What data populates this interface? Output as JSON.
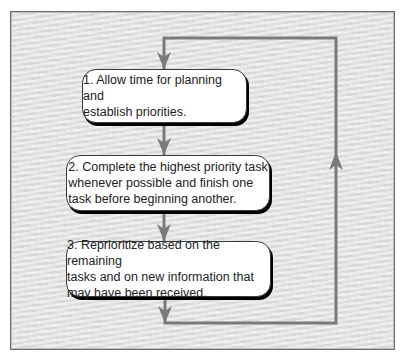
{
  "diagram": {
    "type": "flowchart",
    "colors": {
      "panel_background": "#e3e3e3",
      "panel_border": "#6e6e6e",
      "connector": "#7a7a7a",
      "box_fill": "#ffffff",
      "box_border": "#3a3a3a",
      "box_shadow": "#000000",
      "text": "#222222"
    },
    "steps": [
      {
        "number": "1.",
        "text": "1. Allow time for planning and\n    establish priorities."
      },
      {
        "number": "2.",
        "text": "2. Complete the highest priority task\n    whenever possible and finish one\n    task before beginning another."
      },
      {
        "number": "3.",
        "text": "3. Reprioritize based on the remaining\n    tasks and on new information that\n    may have been received."
      }
    ],
    "connectors": [
      {
        "from": "loop-top",
        "to": "step-1",
        "direction": "down"
      },
      {
        "from": "step-1",
        "to": "step-2",
        "direction": "down"
      },
      {
        "from": "step-2",
        "to": "step-3",
        "direction": "down"
      },
      {
        "from": "step-3",
        "to": "loop-bottom",
        "direction": "down"
      },
      {
        "from": "loop-bottom",
        "to": "loop-top",
        "direction": "up",
        "label": "feedback loop"
      }
    ]
  }
}
